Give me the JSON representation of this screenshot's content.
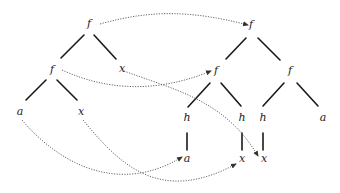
{
  "diagram": {
    "type": "tree-mapping",
    "colors": {
      "edge": "#1a1a1a",
      "link": "#555555",
      "label": "#222222",
      "background": "#ffffff"
    },
    "left_tree": {
      "nodes": [
        {
          "id": "L0",
          "label": "f",
          "x": 89,
          "y": 27
        },
        {
          "id": "L1",
          "label": "f",
          "x": 52,
          "y": 73
        },
        {
          "id": "L2",
          "label": "x",
          "x": 122,
          "y": 72
        },
        {
          "id": "L3",
          "label": "a",
          "x": 20,
          "y": 115
        },
        {
          "id": "L4",
          "label": "x",
          "x": 81,
          "y": 115
        }
      ],
      "edges": [
        {
          "x1": 84,
          "y1": 35,
          "x2": 61,
          "y2": 58
        },
        {
          "x1": 94,
          "y1": 35,
          "x2": 116,
          "y2": 59
        },
        {
          "x1": 46,
          "y1": 80,
          "x2": 26,
          "y2": 100
        },
        {
          "x1": 57,
          "y1": 80,
          "x2": 77,
          "y2": 100
        }
      ]
    },
    "right_tree": {
      "nodes": [
        {
          "id": "R0",
          "label": "f",
          "x": 251,
          "y": 28
        },
        {
          "id": "R1",
          "label": "f",
          "x": 216,
          "y": 74
        },
        {
          "id": "R2",
          "label": "f",
          "x": 290,
          "y": 74
        },
        {
          "id": "R3",
          "label": "h",
          "x": 187,
          "y": 121
        },
        {
          "id": "R4",
          "label": "h",
          "x": 242,
          "y": 121
        },
        {
          "id": "R5",
          "label": "h",
          "x": 263,
          "y": 121
        },
        {
          "id": "R6",
          "label": "a",
          "x": 323,
          "y": 121
        },
        {
          "id": "R7",
          "label": "a",
          "x": 187,
          "y": 162
        },
        {
          "id": "R8",
          "label": "x",
          "x": 242,
          "y": 162
        },
        {
          "id": "R9",
          "label": "x",
          "x": 264,
          "y": 162
        }
      ],
      "edges": [
        {
          "x1": 246,
          "y1": 38,
          "x2": 226,
          "y2": 59
        },
        {
          "x1": 258,
          "y1": 38,
          "x2": 280,
          "y2": 60
        },
        {
          "x1": 210,
          "y1": 83,
          "x2": 188,
          "y2": 107
        },
        {
          "x1": 221,
          "y1": 83,
          "x2": 241,
          "y2": 106
        },
        {
          "x1": 284,
          "y1": 83,
          "x2": 263,
          "y2": 106
        },
        {
          "x1": 297,
          "y1": 83,
          "x2": 318,
          "y2": 106
        },
        {
          "x1": 187,
          "y1": 133,
          "x2": 187,
          "y2": 150
        },
        {
          "x1": 242,
          "y1": 133,
          "x2": 242,
          "y2": 150
        },
        {
          "x1": 263,
          "y1": 133,
          "x2": 263,
          "y2": 150
        }
      ]
    },
    "mappings": [
      {
        "from": "L0",
        "to": "R0",
        "path": "M100 24 C 150 10, 190 10, 248 25"
      },
      {
        "from": "L1",
        "to": "R1",
        "path": "M62 70 C 110 92, 160 92, 211 71"
      },
      {
        "from": "L2",
        "to": "R9",
        "path": "M124 71 C 175 90, 225 100, 258 156"
      },
      {
        "from": "L3",
        "to": "R7",
        "path": "M22 120 C 60 165, 120 195, 182 157"
      },
      {
        "from": "L4",
        "to": "R8",
        "path": "M83 120 C 120 165, 160 205, 236 164"
      }
    ]
  }
}
